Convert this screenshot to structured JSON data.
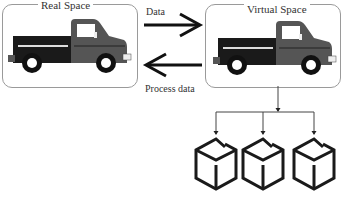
{
  "diagram": {
    "real_space": {
      "label": "Real Space",
      "icon": "pickup-truck-icon"
    },
    "virtual_space": {
      "label": "Virtual Space",
      "icon": "pickup-truck-icon"
    },
    "arrows": {
      "forward": {
        "label": "Data",
        "direction": "real-to-virtual"
      },
      "backward": {
        "label": "Process data",
        "direction": "virtual-to-real"
      }
    },
    "children": [
      {
        "icon": "cube-icon"
      },
      {
        "icon": "cube-icon"
      },
      {
        "icon": "cube-icon"
      }
    ],
    "colors": {
      "truck_bed": "#1a1a1a",
      "truck_cab": "#555555",
      "box_border": "#9a9a9a",
      "line": "#444444"
    }
  }
}
